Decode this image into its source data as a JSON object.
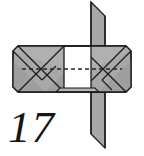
{
  "figure": {
    "step_number": "17",
    "colors": {
      "paper_front": "#ffffff",
      "paper_back": "#a8a8a8",
      "paper_back_light": "#b4b4b4",
      "paper_back_dark": "#9a9a9a",
      "outline": "#1a1a1a",
      "fold_line": "#1a1a1a",
      "dashed_line": "#2a2a2a",
      "background": "#ffffff",
      "number_color": "#161616"
    },
    "parts": {
      "top_flap": "top-vertical-flap",
      "bottom_flap": "bottom-vertical-flap",
      "body": "envelope-body",
      "center_panel": "white-center-panel",
      "left_wing": "left-folded-wing",
      "right_wing": "right-folded-wing",
      "valley_fold": "horizontal-dashed-valley-fold"
    },
    "geometry": {
      "top_flap_points": "91,2 105,16 105,46 91,46",
      "bottom_flap_points": "91,92 105,92 105,148 91,134",
      "body_points": "18,46 126,46 131,51 131,87 126,92 18,92 13,87 13,51",
      "center_panel_points": "64,46 91,46 91,91 64,91",
      "dash_y": "69",
      "dash_x1": "22",
      "dash_x2": "122"
    }
  }
}
